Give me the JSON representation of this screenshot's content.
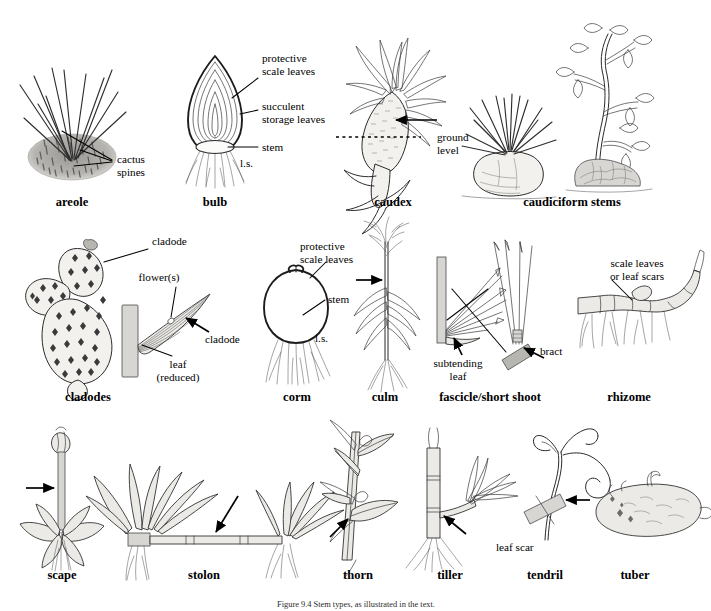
{
  "figure": {
    "caption": "Figure 9.4  Stem types, as illustrated in the text.",
    "background": "#ffffff",
    "ink_color": "#2b2b2b"
  },
  "rows": [
    {
      "row_index": 1,
      "items": [
        {
          "key": "areole",
          "label": "areole",
          "label_x": 72,
          "label_y": 206,
          "annotations": [
            {
              "name": "cactus-spines",
              "lines": [
                "cactus",
                "spines"
              ],
              "x": 117,
              "y": 163
            }
          ]
        },
        {
          "key": "bulb",
          "label": "bulb",
          "label_x": 215,
          "label_y": 206,
          "annotations": [
            {
              "name": "protective-scale-leaves",
              "lines": [
                "protective",
                "scale leaves"
              ],
              "x": 262,
              "y": 62
            },
            {
              "name": "succulent-storage-leaves",
              "lines": [
                "succulent",
                "storage leaves"
              ],
              "x": 262,
              "y": 110
            },
            {
              "name": "stem",
              "lines": [
                "stem"
              ],
              "x": 262,
              "y": 147
            },
            {
              "name": "ls-section",
              "lines": [
                "l.s."
              ],
              "x": 240,
              "y": 167
            }
          ]
        },
        {
          "key": "caudex",
          "label": "caudex",
          "label_x": 393,
          "label_y": 206,
          "annotations": [
            {
              "name": "ground-level",
              "lines": [
                "ground",
                "level"
              ],
              "x": 437,
              "y": 137
            }
          ]
        },
        {
          "key": "caudiciform-stems",
          "label": "caudiciform stems",
          "label_x": 572,
          "label_y": 206,
          "annotations": []
        }
      ]
    },
    {
      "row_index": 2,
      "items": [
        {
          "key": "cladodes",
          "label": "cladodes",
          "label_x": 88,
          "label_y": 401,
          "annotations": [
            {
              "name": "cladode-upper",
              "lines": [
                "cladode"
              ],
              "x": 152,
              "y": 245
            },
            {
              "name": "flowers",
              "lines": [
                "flower(s)"
              ],
              "x": 159,
              "y": 281
            },
            {
              "name": "cladode-lower",
              "lines": [
                "cladode"
              ],
              "x": 205,
              "y": 343
            },
            {
              "name": "leaf-reduced",
              "lines": [
                "leaf",
                "(reduced)"
              ],
              "x": 178,
              "y": 368
            }
          ]
        },
        {
          "key": "corm",
          "label": "corm",
          "label_x": 297,
          "label_y": 401,
          "annotations": [
            {
              "name": "protective-scale-leaves",
              "lines": [
                "protective",
                "scale leaves"
              ],
              "x": 300,
              "y": 250
            },
            {
              "name": "stem",
              "lines": [
                "stem"
              ],
              "x": 328,
              "y": 303
            },
            {
              "name": "ls-section",
              "lines": [
                "l.s."
              ],
              "x": 315,
              "y": 342
            }
          ]
        },
        {
          "key": "culm",
          "label": "culm",
          "label_x": 385,
          "label_y": 401,
          "annotations": []
        },
        {
          "key": "fascicle-short-shoot",
          "label": "fascicle/short shoot",
          "label_x": 490,
          "label_y": 401,
          "annotations": [
            {
              "name": "subtending-leaf",
              "lines": [
                "subtending",
                "leaf"
              ],
              "x": 458,
              "y": 363
            },
            {
              "name": "bract",
              "lines": [
                "bract"
              ],
              "x": 540,
              "y": 355
            }
          ]
        },
        {
          "key": "rhizome",
          "label": "rhizome",
          "label_x": 629,
          "label_y": 401,
          "annotations": [
            {
              "name": "scale-leaves-or-leaf-scars",
              "lines": [
                "scale leaves",
                "or leaf scars"
              ],
              "x": 637,
              "y": 267
            }
          ]
        }
      ]
    },
    {
      "row_index": 3,
      "items": [
        {
          "key": "scape",
          "label": "scape",
          "label_x": 62,
          "label_y": 579,
          "annotations": []
        },
        {
          "key": "stolon",
          "label": "stolon",
          "label_x": 204,
          "label_y": 579,
          "annotations": []
        },
        {
          "key": "thorn",
          "label": "thorn",
          "label_x": 358,
          "label_y": 579,
          "annotations": []
        },
        {
          "key": "tiller",
          "label": "tiller",
          "label_x": 450,
          "label_y": 579,
          "annotations": []
        },
        {
          "key": "tendril",
          "label": "tendril",
          "label_x": 545,
          "label_y": 579,
          "annotations": [
            {
              "name": "leaf-scar",
              "lines": [
                "leaf scar"
              ],
              "x": 527,
              "y": 551
            }
          ]
        },
        {
          "key": "tuber",
          "label": "tuber",
          "label_x": 635,
          "label_y": 579,
          "annotations": []
        }
      ]
    }
  ]
}
